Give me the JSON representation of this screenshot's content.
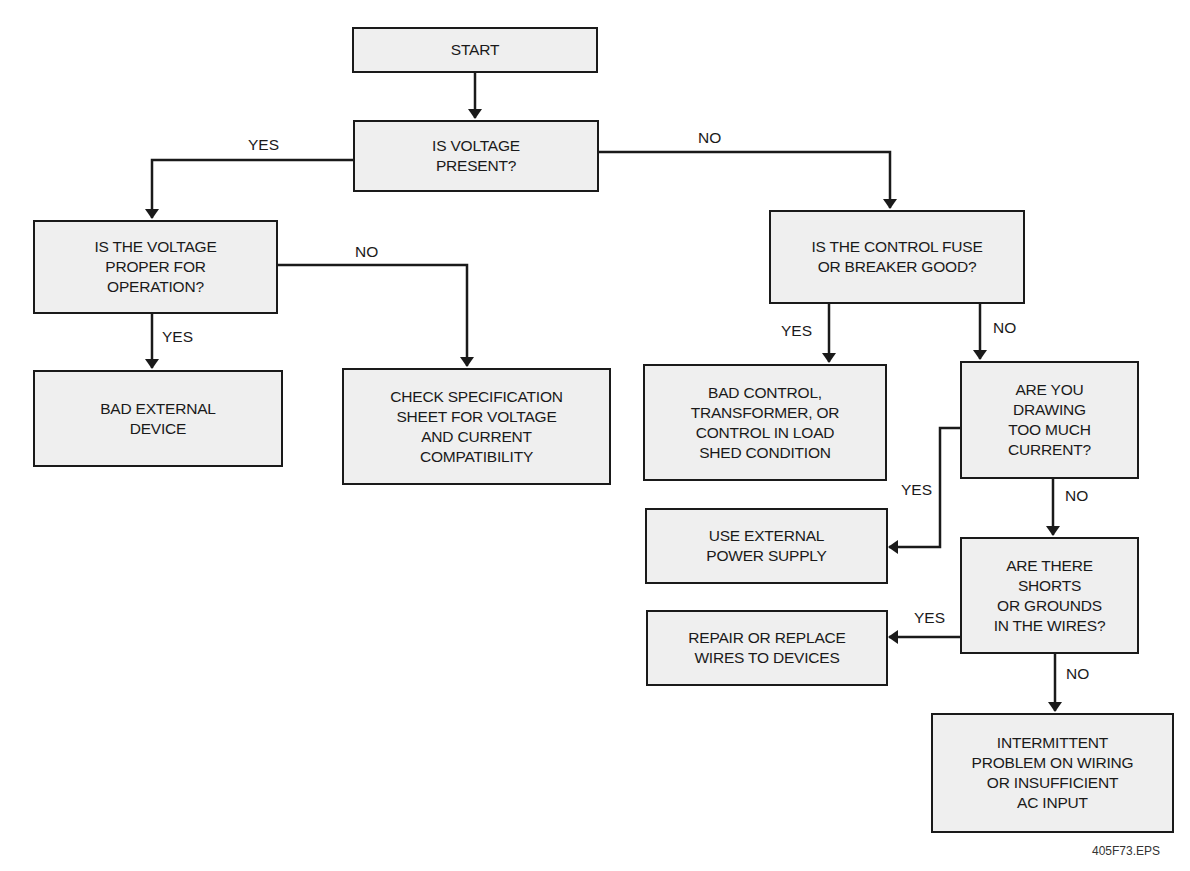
{
  "diagram": {
    "type": "flowchart",
    "title": "",
    "nodes": [
      {
        "id": "start",
        "text": "START"
      },
      {
        "id": "voltage_present",
        "text": "IS VOLTAGE\nPRESENT?"
      },
      {
        "id": "voltage_proper",
        "text": "IS THE VOLTAGE\nPROPER FOR\nOPERATION?"
      },
      {
        "id": "bad_external",
        "text": "BAD EXTERNAL\nDEVICE"
      },
      {
        "id": "check_spec",
        "text": "CHECK SPECIFICATION\nSHEET FOR VOLTAGE\nAND CURRENT\nCOMPATIBILITY"
      },
      {
        "id": "fuse_good",
        "text": "IS THE CONTROL FUSE\nOR BREAKER GOOD?"
      },
      {
        "id": "bad_control",
        "text": "BAD CONTROL,\nTRANSFORMER, OR\nCONTROL IN LOAD\nSHED CONDITION"
      },
      {
        "id": "too_much_current",
        "text": "ARE YOU\nDRAWING\nTOO MUCH\nCURRENT?"
      },
      {
        "id": "use_external",
        "text": "USE EXTERNAL\nPOWER SUPPLY"
      },
      {
        "id": "shorts",
        "text": "ARE THERE\nSHORTS\nOR GROUNDS\nIN THE WIRES?"
      },
      {
        "id": "repair_wires",
        "text": "REPAIR OR REPLACE\nWIRES TO DEVICES"
      },
      {
        "id": "intermittent",
        "text": "INTERMITTENT\nPROBLEM ON WIRING\nOR INSUFFICIENT\nAC INPUT"
      }
    ],
    "edges": [
      {
        "from": "start",
        "to": "voltage_present",
        "label": ""
      },
      {
        "from": "voltage_present",
        "to": "voltage_proper",
        "label": "YES"
      },
      {
        "from": "voltage_present",
        "to": "fuse_good",
        "label": "NO"
      },
      {
        "from": "voltage_proper",
        "to": "bad_external",
        "label": "YES"
      },
      {
        "from": "voltage_proper",
        "to": "check_spec",
        "label": "NO"
      },
      {
        "from": "fuse_good",
        "to": "bad_control",
        "label": "YES"
      },
      {
        "from": "fuse_good",
        "to": "too_much_current",
        "label": "NO"
      },
      {
        "from": "too_much_current",
        "to": "use_external",
        "label": "YES"
      },
      {
        "from": "too_much_current",
        "to": "shorts",
        "label": "NO"
      },
      {
        "from": "shorts",
        "to": "repair_wires",
        "label": "YES"
      },
      {
        "from": "shorts",
        "to": "intermittent",
        "label": "NO"
      }
    ],
    "labels": {
      "yes": "YES",
      "no": "NO"
    },
    "footer": "405F73.EPS",
    "colors": {
      "box_fill": "#efefef",
      "stroke": "#1a1a1a",
      "background": "#ffffff"
    }
  }
}
